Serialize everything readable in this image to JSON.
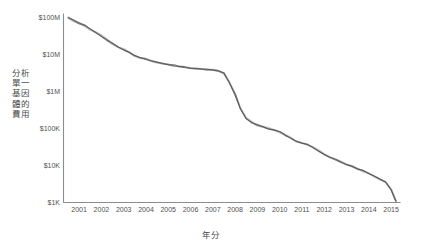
{
  "chart_data": {
    "type": "line",
    "title": "",
    "xlabel": "年分",
    "ylabel": "分析單一基因體的費用",
    "yscale": "log",
    "ylim": [
      1000,
      100000000
    ],
    "ytick_labels": [
      "$100M",
      "$10M",
      "$1M",
      "$100K",
      "$10K",
      "$1K"
    ],
    "ytick_values": [
      100000000,
      10000000,
      1000000,
      100000,
      10000,
      1000
    ],
    "categories": [
      "2001",
      "2002",
      "2003",
      "2004",
      "2005",
      "2006",
      "2007",
      "2008",
      "2009",
      "2010",
      "2011",
      "2012",
      "2013",
      "2014",
      "2015"
    ],
    "xlim": [
      2000.8,
      2015.9
    ],
    "grid": false,
    "legend": false,
    "series": [
      {
        "name": "分析單一基因體的費用",
        "color": "#7a7a7a",
        "x": [
          2001.0,
          2001.25,
          2001.5,
          2001.75,
          2002.0,
          2002.25,
          2002.5,
          2002.75,
          2003.0,
          2003.25,
          2003.5,
          2003.75,
          2004.0,
          2004.25,
          2004.5,
          2004.75,
          2005.0,
          2005.25,
          2005.5,
          2005.75,
          2006.0,
          2006.25,
          2006.5,
          2006.75,
          2007.0,
          2007.25,
          2007.5,
          2007.75,
          2008.0,
          2008.25,
          2008.5,
          2008.75,
          2009.0,
          2009.25,
          2009.5,
          2009.75,
          2010.0,
          2010.25,
          2010.5,
          2010.75,
          2011.0,
          2011.25,
          2011.5,
          2011.75,
          2012.0,
          2012.25,
          2012.5,
          2012.75,
          2013.0,
          2013.25,
          2013.5,
          2013.75,
          2014.0,
          2014.25,
          2014.5,
          2014.75,
          2015.0,
          2015.25,
          2015.5,
          2015.7
        ],
        "y": [
          95000000,
          80000000,
          68000000,
          58000000,
          48000000,
          38000000,
          30000000,
          24000000,
          19000000,
          15500000,
          13000000,
          11000000,
          9200000,
          8000000,
          7200000,
          6500000,
          6000000,
          5600000,
          5200000,
          4900000,
          4600000,
          4400000,
          4200000,
          4000000,
          3900000,
          3800000,
          3700000,
          3500000,
          3000000,
          1700000,
          800000,
          330000,
          180000,
          140000,
          120000,
          108000,
          97000,
          88000,
          77000,
          64000,
          52000,
          44000,
          39000,
          35000,
          30000,
          24000,
          19000,
          16000,
          14000,
          12000,
          10500,
          9200,
          8000,
          7000,
          6000,
          5000,
          4200,
          3400,
          2200,
          1050
        ]
      }
    ],
    "annotations": []
  },
  "axes": {
    "y_axis_title": "分析單一基因體的費用",
    "x_axis_title": "年分"
  }
}
